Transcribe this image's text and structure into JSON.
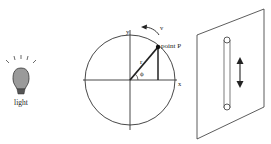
{
  "diagram": {
    "light": {
      "label": "light",
      "icon": "light-bulb-icon",
      "fill": "#9a9a9a"
    },
    "circle": {
      "x_axis_label": "x",
      "y_axis_label": "y",
      "radius_label": "r",
      "angle_label": "ϕ",
      "point_label": "point P",
      "velocity_label": "v"
    },
    "screen": {
      "slot": "vertical-slot",
      "arrow": "double-headed-vertical-arrow"
    }
  }
}
